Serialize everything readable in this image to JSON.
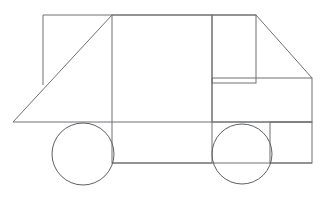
{
  "page": {
    "width": 327,
    "height": 216,
    "background_color": "#ffffff",
    "stroke_color": "#6f7072",
    "wheel_stroke_color": "#5e5f61",
    "stroke_width": 1
  },
  "figure": {
    "name": "truck-side-view-outline",
    "parts": [
      {
        "id": "ground-line",
        "label": "ground-line",
        "type": "polyline",
        "points": "13,122 312,122"
      },
      {
        "id": "cargo-box",
        "label": "cargo-box",
        "type": "rect",
        "x": 112,
        "y": 15,
        "width": 100,
        "height": 148
      },
      {
        "id": "cargo-roof-line",
        "label": "cargo-roof-line",
        "type": "polyline",
        "points": "43,15 256,15"
      },
      {
        "id": "cargo-front-post",
        "label": "cargo-front-post",
        "type": "polyline",
        "points": "43,15 43,85"
      },
      {
        "id": "cargo-slope-diagonal",
        "label": "cargo-slope-diagonal",
        "type": "polyline",
        "points": "13,122 112,15"
      },
      {
        "id": "cab-window-box",
        "label": "cab-window-box",
        "type": "rect",
        "x": 212,
        "y": 15,
        "width": 44,
        "height": 68
      },
      {
        "id": "windshield-diagonal",
        "label": "windshield-diagonal",
        "type": "polyline",
        "points": "256,15 312,78"
      },
      {
        "id": "hood-box",
        "label": "hood-box",
        "type": "rect",
        "x": 212,
        "y": 78,
        "width": 100,
        "height": 44
      },
      {
        "id": "bumper-box",
        "label": "bumper-box",
        "type": "rect",
        "x": 270,
        "y": 122,
        "width": 42,
        "height": 41
      },
      {
        "id": "chassis-bottom-line",
        "label": "chassis-bottom-line",
        "type": "polyline",
        "points": "112,163 312,163"
      }
    ],
    "wheels": [
      {
        "id": "rear-wheel",
        "label": "rear-wheel",
        "cx": 83,
        "cy": 154,
        "r": 31
      },
      {
        "id": "front-wheel",
        "label": "front-wheel",
        "cx": 242,
        "cy": 154,
        "r": 30
      }
    ]
  }
}
